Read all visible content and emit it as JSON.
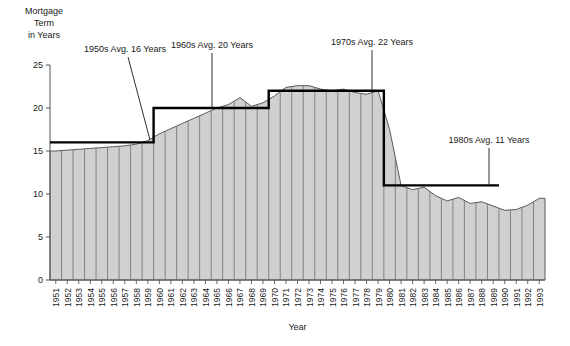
{
  "chart_data": {
    "type": "area",
    "title": "",
    "ylabel_lines": [
      "Mortgage",
      "Term",
      "in Years"
    ],
    "xlabel": "Year",
    "ylim": [
      0,
      25
    ],
    "yticks": [
      0,
      5,
      10,
      15,
      20,
      25
    ],
    "ytick_labels": [
      "0",
      "5",
      "10",
      "15",
      "20",
      "25"
    ],
    "grid": false,
    "legend": "none",
    "categories": [
      "1951",
      "1952",
      "1953",
      "1954",
      "1955",
      "1956",
      "1957",
      "1958",
      "1959",
      "1960",
      "1961",
      "1962",
      "1963",
      "1964",
      "1965",
      "1966",
      "1967",
      "1968",
      "1969",
      "1970",
      "1971",
      "1972",
      "1973",
      "1974",
      "1975",
      "1976",
      "1977",
      "1978",
      "1979",
      "1980",
      "1981",
      "1982",
      "1983",
      "1984",
      "1985",
      "1986",
      "1987",
      "1988",
      "1989",
      "1990",
      "1991",
      "1992",
      "1993"
    ],
    "values": [
      15.0,
      15.1,
      15.2,
      15.3,
      15.4,
      15.5,
      15.6,
      15.8,
      16.2,
      17.0,
      17.6,
      18.2,
      18.8,
      19.4,
      20.0,
      20.4,
      21.2,
      20.2,
      20.6,
      21.4,
      22.4,
      22.6,
      22.6,
      22.2,
      22.0,
      22.2,
      21.8,
      21.6,
      22.0,
      17.5,
      11.0,
      10.5,
      10.8,
      9.8,
      9.2,
      9.6,
      8.9,
      9.1,
      8.6,
      8.1,
      8.2,
      8.7,
      9.5
    ],
    "series_name": "Mortgage Term",
    "annotations": [
      {
        "label": "1950s Avg. 16 Years",
        "decade": "1950s",
        "avg": 16,
        "start": "1951",
        "end": "1959"
      },
      {
        "label": "1960s Avg. 20 Years",
        "decade": "1960s",
        "avg": 20,
        "start": "1960",
        "end": "1969"
      },
      {
        "label": "1970s Avg. 22 Years",
        "decade": "1970s",
        "avg": 22,
        "start": "1970",
        "end": "1979"
      },
      {
        "label": "1980s Avg. 11 Years",
        "decade": "1980s",
        "avg": 11,
        "start": "1980",
        "end": "1989"
      }
    ],
    "colors": {
      "area_fill": "#d0d0d0",
      "area_edge": "#4a4a4a",
      "avg_line": "#000000",
      "axis": "#555555"
    }
  }
}
